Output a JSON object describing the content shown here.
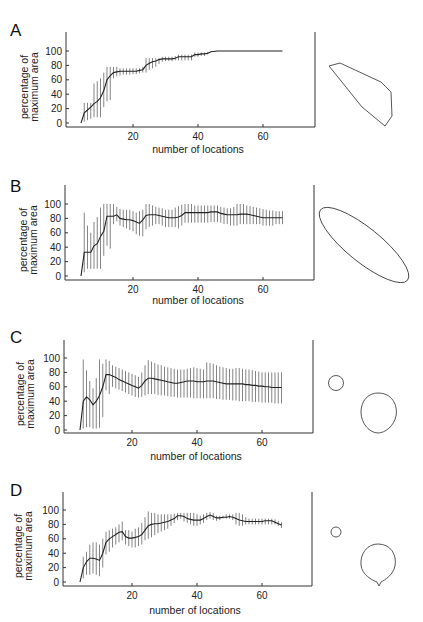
{
  "figure": {
    "panels": [
      {
        "letter": "A",
        "xlabel": "number of locations",
        "ylabel_line1": "percentage of",
        "ylabel_line2": "maximum area",
        "shape": "irregular-polygon"
      },
      {
        "letter": "B",
        "xlabel": "number of locations",
        "ylabel_line1": "percentage of",
        "ylabel_line2": "maximum area",
        "shape": "ellipse"
      },
      {
        "letter": "C",
        "xlabel": "number of locations",
        "ylabel_line1": "percentage of",
        "ylabel_line2": "maximum area",
        "shape": "small-circle-and-large-oval"
      },
      {
        "letter": "D",
        "xlabel": "number of locations",
        "ylabel_line1": "percentage of",
        "ylabel_line2": "maximum area",
        "shape": "small-circle-and-teardrop"
      }
    ]
  },
  "chart_data": [
    {
      "type": "line",
      "panel": "A",
      "title": "",
      "xlabel": "number of locations",
      "ylabel": "percentage of maximum area",
      "xticks": [
        20,
        40,
        60
      ],
      "yticks": [
        0,
        20,
        40,
        60,
        80,
        100
      ],
      "xlim": [
        0,
        76
      ],
      "ylim": [
        -5,
        120
      ],
      "grid": false,
      "error_bars": true,
      "x": [
        4,
        5,
        6,
        7,
        8,
        9,
        10,
        11,
        12,
        13,
        14,
        15,
        16,
        17,
        18,
        19,
        20,
        21,
        22,
        23,
        24,
        25,
        26,
        27,
        28,
        29,
        30,
        31,
        32,
        33,
        34,
        35,
        36,
        37,
        38,
        39,
        40,
        41,
        42,
        43,
        44,
        46,
        50,
        55,
        60,
        66
      ],
      "mean": [
        0,
        14,
        18,
        22,
        27,
        30,
        35,
        45,
        60,
        66,
        70,
        71,
        72,
        72,
        72,
        72,
        72,
        72,
        73,
        74,
        80,
        83,
        85,
        86,
        88,
        89,
        89,
        89,
        89,
        90,
        92,
        92,
        92,
        92,
        92,
        95,
        95,
        96,
        96,
        97,
        99,
        100,
        100,
        100,
        100,
        100
      ],
      "lower": [
        0,
        2,
        4,
        6,
        8,
        8,
        8,
        22,
        30,
        32,
        62,
        65,
        66,
        67,
        67,
        67,
        68,
        68,
        69,
        70,
        70,
        74,
        76,
        78,
        82,
        85,
        86,
        86,
        86,
        87,
        87,
        87,
        87,
        87,
        87,
        92,
        92,
        93,
        93,
        95,
        99,
        100,
        100,
        100,
        100,
        100
      ],
      "upper": [
        0,
        28,
        28,
        28,
        55,
        58,
        62,
        70,
        78,
        78,
        78,
        78,
        76,
        76,
        76,
        76,
        76,
        76,
        76,
        78,
        90,
        90,
        90,
        90,
        90,
        92,
        92,
        92,
        92,
        93,
        95,
        95,
        95,
        95,
        95,
        98,
        98,
        98,
        98,
        99,
        99,
        100,
        100,
        100,
        100,
        100
      ]
    },
    {
      "type": "line",
      "panel": "B",
      "title": "",
      "xlabel": "number of locations",
      "ylabel": "percentage of maximum area",
      "xticks": [
        20,
        40,
        60
      ],
      "yticks": [
        0,
        20,
        40,
        60,
        80,
        100
      ],
      "xlim": [
        0,
        76
      ],
      "ylim": [
        -5,
        120
      ],
      "grid": false,
      "error_bars": true,
      "x": [
        4,
        5,
        6,
        7,
        8,
        9,
        10,
        11,
        12,
        13,
        14,
        15,
        16,
        17,
        18,
        19,
        20,
        21,
        22,
        23,
        24,
        25,
        26,
        27,
        28,
        29,
        30,
        31,
        32,
        33,
        34,
        35,
        36,
        37,
        38,
        39,
        40,
        41,
        42,
        43,
        44,
        45,
        46,
        47,
        48,
        49,
        50,
        51,
        52,
        53,
        54,
        55,
        56,
        57,
        58,
        59,
        60,
        61,
        62,
        63,
        64,
        65,
        66
      ],
      "mean": [
        0,
        33,
        33,
        33,
        42,
        45,
        55,
        62,
        83,
        83,
        83,
        85,
        80,
        79,
        78,
        78,
        77,
        75,
        73,
        78,
        84,
        85,
        85,
        85,
        84,
        83,
        82,
        81,
        81,
        81,
        82,
        84,
        88,
        88,
        88,
        88,
        88,
        88,
        88,
        88,
        89,
        89,
        89,
        87,
        86,
        85,
        85,
        85,
        85,
        86,
        86,
        86,
        85,
        84,
        83,
        82,
        81,
        81,
        81,
        81,
        81,
        81,
        81
      ],
      "lower": [
        0,
        5,
        10,
        10,
        10,
        10,
        10,
        28,
        42,
        38,
        72,
        76,
        70,
        68,
        66,
        64,
        62,
        58,
        56,
        55,
        65,
        68,
        70,
        72,
        72,
        70,
        68,
        68,
        68,
        68,
        66,
        70,
        74,
        74,
        74,
        74,
        74,
        74,
        74,
        74,
        75,
        75,
        75,
        74,
        72,
        72,
        70,
        70,
        70,
        72,
        72,
        72,
        72,
        72,
        72,
        72,
        70,
        70,
        70,
        70,
        72,
        72,
        72
      ],
      "upper": [
        0,
        88,
        70,
        60,
        75,
        82,
        95,
        100,
        100,
        100,
        100,
        96,
        93,
        92,
        92,
        92,
        90,
        88,
        90,
        92,
        100,
        100,
        98,
        96,
        95,
        94,
        92,
        92,
        92,
        95,
        97,
        99,
        100,
        100,
        100,
        98,
        98,
        98,
        98,
        98,
        98,
        98,
        98,
        96,
        95,
        94,
        94,
        96,
        100,
        100,
        100,
        98,
        97,
        96,
        95,
        94,
        93,
        92,
        91,
        91,
        90,
        90,
        90
      ]
    },
    {
      "type": "line",
      "panel": "C",
      "title": "",
      "xlabel": "number of locations",
      "ylabel": "percentage of maximum area",
      "xticks": [
        20,
        40,
        60
      ],
      "yticks": [
        0,
        20,
        40,
        60,
        80,
        100
      ],
      "xlim": [
        0,
        76
      ],
      "ylim": [
        -5,
        120
      ],
      "grid": false,
      "error_bars": true,
      "x": [
        4,
        5,
        6,
        7,
        8,
        9,
        10,
        11,
        12,
        13,
        14,
        15,
        16,
        17,
        18,
        19,
        20,
        21,
        22,
        23,
        24,
        25,
        26,
        27,
        28,
        29,
        30,
        31,
        32,
        33,
        34,
        35,
        36,
        37,
        38,
        39,
        40,
        41,
        42,
        43,
        44,
        45,
        46,
        47,
        48,
        49,
        50,
        51,
        52,
        53,
        54,
        55,
        56,
        57,
        58,
        59,
        60,
        61,
        62,
        63,
        64,
        65,
        66
      ],
      "mean": [
        0,
        40,
        46,
        42,
        35,
        40,
        48,
        60,
        77,
        77,
        75,
        73,
        70,
        68,
        66,
        64,
        62,
        60,
        58,
        62,
        68,
        72,
        72,
        71,
        70,
        69,
        68,
        67,
        66,
        65,
        65,
        66,
        67,
        68,
        68,
        68,
        67,
        67,
        67,
        68,
        68,
        68,
        67,
        66,
        65,
        64,
        64,
        64,
        64,
        64,
        64,
        63,
        63,
        62,
        62,
        61,
        61,
        60,
        60,
        59,
        59,
        59,
        59
      ],
      "lower": [
        0,
        2,
        4,
        4,
        2,
        2,
        3,
        18,
        55,
        50,
        60,
        58,
        56,
        54,
        52,
        50,
        48,
        46,
        45,
        46,
        48,
        50,
        50,
        50,
        49,
        48,
        48,
        47,
        46,
        46,
        45,
        45,
        45,
        45,
        45,
        44,
        44,
        44,
        44,
        44,
        44,
        44,
        43,
        43,
        42,
        42,
        42,
        41,
        41,
        40,
        40,
        40,
        40,
        39,
        39,
        39,
        38,
        38,
        38,
        38,
        37,
        37,
        37
      ],
      "upper": [
        0,
        98,
        83,
        68,
        58,
        72,
        98,
        92,
        98,
        96,
        90,
        88,
        86,
        84,
        82,
        80,
        78,
        76,
        74,
        80,
        90,
        97,
        95,
        93,
        91,
        90,
        88,
        87,
        86,
        85,
        84,
        84,
        84,
        85,
        86,
        87,
        86,
        85,
        84,
        94,
        93,
        92,
        90,
        88,
        87,
        86,
        85,
        85,
        86,
        86,
        85,
        84,
        84,
        83,
        82,
        81,
        80,
        80,
        80,
        80,
        80,
        80,
        80
      ]
    },
    {
      "type": "line",
      "panel": "D",
      "title": "",
      "xlabel": "number of locations",
      "ylabel": "percentage of maximum area",
      "xticks": [
        20,
        40,
        60
      ],
      "yticks": [
        0,
        20,
        40,
        60,
        80,
        100
      ],
      "xlim": [
        0,
        76
      ],
      "ylim": [
        -5,
        120
      ],
      "grid": false,
      "error_bars": true,
      "x": [
        4,
        5,
        6,
        7,
        8,
        9,
        10,
        11,
        12,
        13,
        14,
        15,
        16,
        17,
        18,
        19,
        20,
        21,
        22,
        23,
        24,
        25,
        26,
        27,
        28,
        29,
        30,
        31,
        32,
        33,
        34,
        35,
        36,
        37,
        38,
        39,
        40,
        41,
        42,
        43,
        44,
        45,
        46,
        47,
        48,
        49,
        50,
        51,
        52,
        53,
        54,
        55,
        56,
        57,
        58,
        59,
        60,
        61,
        62,
        63,
        64,
        65,
        66
      ],
      "mean": [
        0,
        20,
        28,
        33,
        33,
        32,
        30,
        40,
        55,
        60,
        63,
        66,
        69,
        70,
        63,
        61,
        61,
        62,
        63,
        66,
        72,
        78,
        80,
        81,
        81,
        82,
        83,
        84,
        86,
        88,
        92,
        92,
        91,
        88,
        87,
        86,
        86,
        86,
        88,
        91,
        93,
        91,
        89,
        89,
        90,
        90,
        91,
        90,
        88,
        86,
        85,
        84,
        84,
        84,
        84,
        84,
        84,
        85,
        85,
        85,
        83,
        81,
        79
      ],
      "lower": [
        0,
        5,
        10,
        10,
        12,
        10,
        8,
        20,
        38,
        42,
        48,
        52,
        55,
        58,
        52,
        50,
        48,
        48,
        50,
        52,
        58,
        60,
        62,
        65,
        68,
        70,
        72,
        74,
        78,
        82,
        86,
        88,
        84,
        82,
        80,
        78,
        78,
        80,
        82,
        86,
        88,
        86,
        85,
        86,
        88,
        88,
        88,
        86,
        80,
        78,
        78,
        80,
        80,
        80,
        80,
        80,
        80,
        80,
        80,
        80,
        80,
        78,
        75
      ],
      "upper": [
        0,
        35,
        42,
        52,
        55,
        55,
        52,
        60,
        70,
        72,
        74,
        76,
        80,
        84,
        72,
        72,
        70,
        74,
        76,
        82,
        90,
        98,
        96,
        96,
        94,
        94,
        94,
        94,
        94,
        95,
        96,
        96,
        96,
        96,
        96,
        96,
        94,
        92,
        94,
        96,
        97,
        96,
        92,
        92,
        92,
        94,
        94,
        94,
        96,
        96,
        94,
        90,
        88,
        88,
        88,
        88,
        88,
        88,
        88,
        88,
        87,
        85,
        83
      ]
    }
  ]
}
